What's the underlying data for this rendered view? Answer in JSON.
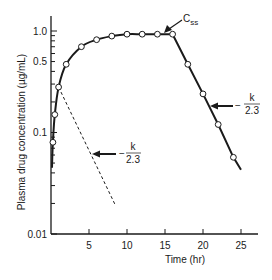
{
  "chart_data": {
    "type": "line",
    "title": "",
    "xlabel": "Time (hr)",
    "ylabel": "Plasma drug concentration (µg/mL)",
    "xscale": "linear",
    "yscale": "log",
    "xlim": [
      0,
      27
    ],
    "ylim": [
      0.01,
      1.5
    ],
    "x_ticks": [
      5,
      10,
      15,
      20,
      25
    ],
    "x_tick_labels": [
      "5",
      "10",
      "15",
      "20",
      "25"
    ],
    "y_ticks": [
      0.01,
      0.1,
      0.5,
      1.0
    ],
    "y_tick_labels": [
      "0.01",
      "0.1",
      "0.5",
      "1.0"
    ],
    "grid": false,
    "legend": null,
    "series": [
      {
        "name": "Infusion then elimination (observed)",
        "style": "solid line with open circle markers",
        "x": [
          0.25,
          0.5,
          1,
          2,
          4,
          6,
          8,
          10,
          12,
          14,
          16,
          18,
          20,
          22,
          24
        ],
        "values": [
          0.08,
          0.15,
          0.28,
          0.47,
          0.7,
          0.82,
          0.89,
          0.93,
          0.93,
          0.93,
          0.93,
          0.47,
          0.24,
          0.12,
          0.057
        ]
      },
      {
        "name": "Extrapolated elimination line",
        "style": "dashed line",
        "x": [
          1,
          8.5
        ],
        "values": [
          0.28,
          0.019
        ]
      }
    ],
    "annotations": [
      {
        "text": "Css",
        "subscript": "ss",
        "base": "C",
        "points_to": {
          "x": 15.5,
          "y": 0.93
        }
      },
      {
        "text": "− k / 2.3",
        "numerator": "k",
        "denominator": "2.3",
        "sign": "−",
        "points_to": "dashed line",
        "at": {
          "x": 5.5,
          "y": 0.044
        }
      },
      {
        "text": "− k / 2.3",
        "numerator": "k",
        "denominator": "2.3",
        "sign": "−",
        "points_to": "elimination phase",
        "at": {
          "x": 21.5,
          "y": 0.16
        }
      }
    ]
  },
  "labels": {
    "xlabel": "Time (hr)",
    "ylabel": "Plasma drug concentration (µg/mL)",
    "css_base": "C",
    "css_sub": "ss",
    "slope_sign": "−",
    "slope_num": "k",
    "slope_den": "2.3"
  }
}
